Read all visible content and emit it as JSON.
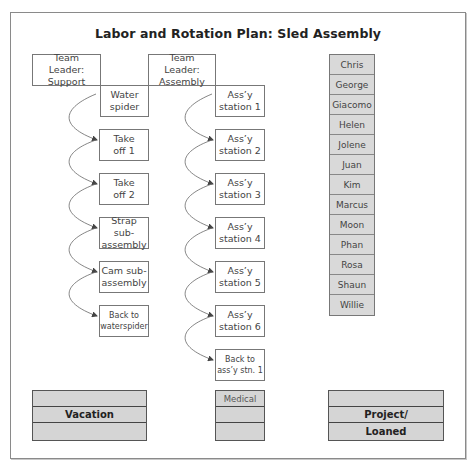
{
  "title": "Labor and Rotation Plan: Sled Assembly",
  "team_leaders": {
    "support": "Team Leader: Support",
    "assembly": "Team Leader: Assembly"
  },
  "support_rotation": [
    {
      "line1": "Water",
      "line2": "spider"
    },
    {
      "line1": "Take",
      "line2": "off 1"
    },
    {
      "line1": "Take",
      "line2": "off 2"
    },
    {
      "line1": "Strap sub-",
      "line2": "assembly"
    },
    {
      "line1": "Cam sub-",
      "line2": "assembly"
    },
    {
      "line1": "Back to",
      "line2": "waterspider"
    }
  ],
  "assembly_rotation": [
    {
      "line1": "Ass’y",
      "line2": "station 1"
    },
    {
      "line1": "Ass’y",
      "line2": "station 2"
    },
    {
      "line1": "Ass’y",
      "line2": "station 3"
    },
    {
      "line1": "Ass’y",
      "line2": "station 4"
    },
    {
      "line1": "Ass’y",
      "line2": "station 5"
    },
    {
      "line1": "Ass’y",
      "line2": "station 6"
    },
    {
      "line1": "Back to",
      "line2": "ass’y stn. 1"
    }
  ],
  "team_members": [
    "Chris",
    "George",
    "Giacomo",
    "Helen",
    "Jolene",
    "Juan",
    "Kim",
    "Marcus",
    "Moon",
    "Phan",
    "Rosa",
    "Shaun",
    "Willie"
  ],
  "bottom_groups": {
    "vacation": [
      "",
      "Vacation",
      ""
    ],
    "medical": [
      "Medical",
      "",
      ""
    ],
    "project_loaned": [
      "",
      "Project/",
      "Loaned"
    ]
  }
}
